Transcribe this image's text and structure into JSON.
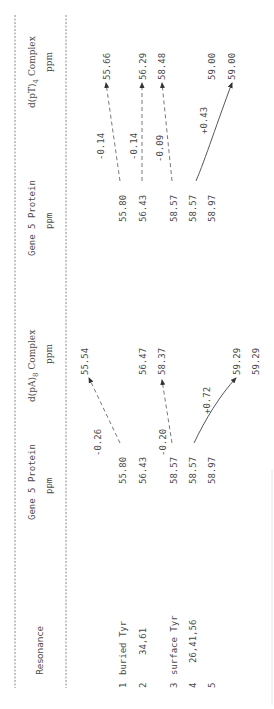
{
  "table": {
    "orientation": "rotated-90-ccw",
    "headers": {
      "resonance": "Resonance",
      "gene5_a": {
        "line1": "Gene 5 Protein",
        "line2": "ppm"
      },
      "dpa8": {
        "line1": "d(pA)",
        "sub": "8",
        "line1b": " Complex",
        "line2": "ppm"
      },
      "gene5_b": {
        "line1": "Gene 5 Protein",
        "line2": "ppm"
      },
      "dpt4": {
        "line1": "d(pT)",
        "sub": "4",
        "line1b": " Complex",
        "line2": "ppm"
      }
    },
    "rows": [
      {
        "num": "1",
        "label": "buried Tyr",
        "gene5_a": "55.80",
        "dpa8": "55.54",
        "gene5_b": "55.80",
        "dpt4": "55.66"
      },
      {
        "num": "2",
        "label": "34,61",
        "gene5_a": "56.43",
        "dpa8": "56.47",
        "gene5_b": "56.43",
        "dpt4": "56.29"
      },
      {
        "num": "3",
        "label": "",
        "gene5_a": "58.57",
        "dpa8": "58.37",
        "gene5_b": "58.57",
        "dpt4": "58.48"
      },
      {
        "num": "4",
        "label": "surface Tyr",
        "gene5_a": "58.57",
        "dpa8": "59.29",
        "gene5_b": "58.57",
        "dpt4": "59.00"
      },
      {
        "num": "5",
        "label": "26,41,56",
        "gene5_a": "58.97",
        "dpa8": "59.29",
        "gene5_b": "58.97",
        "dpt4": "59.00"
      }
    ],
    "shifts_pa8": [
      "-0.26",
      "-0.20",
      "+0.72"
    ],
    "shifts_pt4": [
      "-0.14",
      "-0.14",
      "-0.09",
      "+0.43"
    ]
  }
}
